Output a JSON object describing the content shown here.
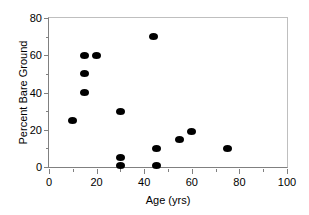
{
  "chart_data": {
    "type": "scatter",
    "title": "",
    "xlabel": "Age (yrs)",
    "ylabel": "Percent Bare Ground",
    "xlim": [
      0,
      100
    ],
    "ylim": [
      0,
      80
    ],
    "xticks": [
      0,
      20,
      40,
      60,
      80,
      100
    ],
    "yticks": [
      0,
      20,
      40,
      60,
      80
    ],
    "xtick_labels": [
      "0",
      "20",
      "40",
      "60",
      "80",
      "100"
    ],
    "ytick_labels": [
      "0",
      "20",
      "40",
      "60",
      "80"
    ],
    "x_minor_ticks": [
      10,
      30,
      50,
      70,
      90
    ],
    "y_minor_ticks": [
      10,
      30,
      50,
      70
    ],
    "grid": false,
    "legend": null,
    "marker_color": "#000000",
    "marker_shape": "filled-circle",
    "axis_color": "#808080",
    "points": [
      {
        "x": 10,
        "y": 25
      },
      {
        "x": 15,
        "y": 60
      },
      {
        "x": 20,
        "y": 60
      },
      {
        "x": 15,
        "y": 50
      },
      {
        "x": 15,
        "y": 40
      },
      {
        "x": 30,
        "y": 30
      },
      {
        "x": 30,
        "y": 5
      },
      {
        "x": 30,
        "y": 1
      },
      {
        "x": 44,
        "y": 70
      },
      {
        "x": 45,
        "y": 10
      },
      {
        "x": 45,
        "y": 1
      },
      {
        "x": 55,
        "y": 15
      },
      {
        "x": 60,
        "y": 19
      },
      {
        "x": 75,
        "y": 10
      }
    ]
  }
}
